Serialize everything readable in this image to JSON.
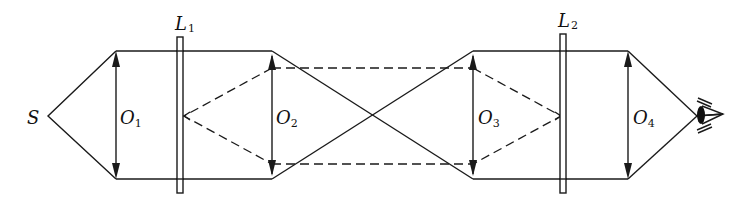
{
  "diagram": {
    "type": "optical-ray-diagram",
    "labels": {
      "source": "S",
      "lens1": {
        "main": "L",
        "sub": "1"
      },
      "lens2": {
        "main": "L",
        "sub": "2"
      },
      "object1": {
        "main": "O",
        "sub": "1"
      },
      "object2": {
        "main": "O",
        "sub": "2"
      },
      "object3": {
        "main": "O",
        "sub": "3"
      },
      "object4": {
        "main": "O",
        "sub": "4"
      }
    },
    "elements": [
      {
        "id": "S",
        "kind": "point-source"
      },
      {
        "id": "O1",
        "kind": "double-arrow-object"
      },
      {
        "id": "L1",
        "kind": "lens-plate"
      },
      {
        "id": "O2",
        "kind": "double-arrow-image"
      },
      {
        "id": "O3",
        "kind": "double-arrow-image"
      },
      {
        "id": "L2",
        "kind": "lens-plate"
      },
      {
        "id": "O4",
        "kind": "double-arrow-image"
      },
      {
        "id": "eye",
        "kind": "observer-eye"
      }
    ],
    "line_color": "#1a1a1a",
    "background": "#ffffff"
  }
}
